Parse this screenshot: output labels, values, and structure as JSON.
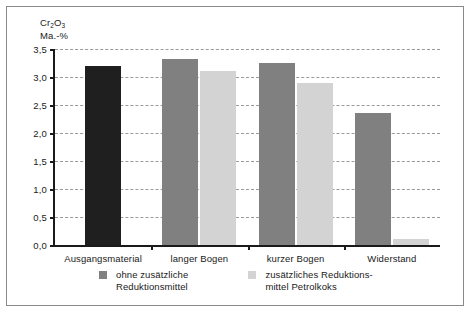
{
  "chart_data": {
    "type": "bar",
    "title": "",
    "subtitle": "",
    "ylabel_line1": "Cr",
    "ylabel_sub1": "2",
    "ylabel_mid": "O",
    "ylabel_sub2": "3",
    "ylabel_line2": "Ma.-%",
    "xlabel": "",
    "ylim": [
      0,
      3.5
    ],
    "ytick_step": 0.5,
    "yticks": [
      "0,0",
      "0,5",
      "1,0",
      "1,5",
      "2,0",
      "2,5",
      "3,0",
      "3,5"
    ],
    "ytick_values": [
      0.0,
      0.5,
      1.0,
      1.5,
      2.0,
      2.5,
      3.0,
      3.5
    ],
    "grid": true,
    "grid_style": "dashed-horizontal",
    "legend_position": "bottom",
    "categories": [
      "Ausgangsmaterial",
      "langer Bogen",
      "kurzer Bogen",
      "Widerstand"
    ],
    "series": [
      {
        "name": "ohne zusätzliche Reduktionsmittel",
        "color": "#808080",
        "values": [
          3.2,
          3.32,
          3.25,
          2.35
        ]
      },
      {
        "name": "zusätzliches Reduktions-mittel Petrolkoks",
        "color": "#d3d3d3",
        "values": [
          null,
          3.1,
          2.9,
          0.1
        ]
      }
    ]
  },
  "axis": {
    "y_title_top": "Cr₂O₃",
    "y_title_bottom": "Ma.-%",
    "tick_0": "0,0",
    "tick_1": "0,5",
    "tick_2": "1,0",
    "tick_3": "1,5",
    "tick_4": "2,0",
    "tick_5": "2,5",
    "tick_6": "3,0",
    "tick_7": "3,5"
  },
  "categories": {
    "c0": "Ausgangsmaterial",
    "c1": "langer Bogen",
    "c2": "kurzer Bogen",
    "c3": "Widerstand"
  },
  "legend": {
    "entry1": "ohne zusätzliche\nReduktionsmittel",
    "entry2": "zusätzliches Reduktions-\nmittel Petrolkoks",
    "entry1_color": "#808080",
    "entry2_color": "#d3d3d3"
  }
}
